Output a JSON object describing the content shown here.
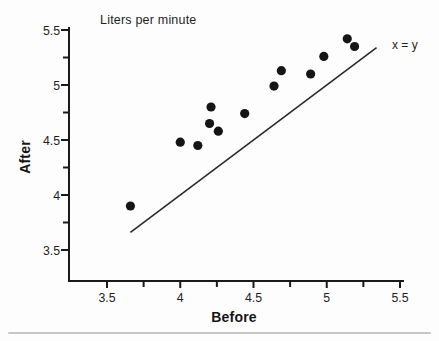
{
  "figure": {
    "title": "Liters per minute",
    "annotation": "x = y",
    "xlabel": "Before",
    "ylabel": "After"
  },
  "chart_data": {
    "type": "scatter",
    "title": "Liters per minute",
    "xlabel": "Before",
    "ylabel": "After",
    "xlim": [
      3.25,
      5.55
    ],
    "ylim": [
      3.22,
      5.53
    ],
    "x_major_ticks": [
      3.5,
      4,
      4.5,
      5,
      5.5
    ],
    "x_tick_labels": [
      "3.5",
      "4",
      "4.5",
      "5",
      "5.5"
    ],
    "x_minor_ticks": [
      3.75,
      4.25,
      4.75,
      5.25
    ],
    "y_major_ticks": [
      3.5,
      4,
      4.5,
      5,
      5.5
    ],
    "y_tick_labels": [
      "3.5",
      "4",
      "4.5",
      "5",
      "5.5"
    ],
    "y_minor_ticks": [
      3.75,
      4.25,
      4.75,
      5.25
    ],
    "grid": false,
    "points": [
      [
        3.66,
        3.9
      ],
      [
        4.0,
        4.48
      ],
      [
        4.12,
        4.45
      ],
      [
        4.2,
        4.65
      ],
      [
        4.21,
        4.8
      ],
      [
        4.26,
        4.58
      ],
      [
        4.44,
        4.74
      ],
      [
        4.64,
        4.99
      ],
      [
        4.69,
        5.13
      ],
      [
        4.89,
        5.1
      ],
      [
        4.98,
        5.26
      ],
      [
        5.14,
        5.42
      ],
      [
        5.19,
        5.35
      ]
    ],
    "reference_line": {
      "label": "x = y",
      "from": [
        3.66,
        3.66
      ],
      "to": [
        5.34,
        5.34
      ]
    },
    "colors": {
      "point": "#151515",
      "axis": "#1a1a1a",
      "line": "#2a2a2a",
      "text": "#1f1f1f",
      "divider": "#c6c6c6",
      "background": "#fdfdfd"
    }
  }
}
